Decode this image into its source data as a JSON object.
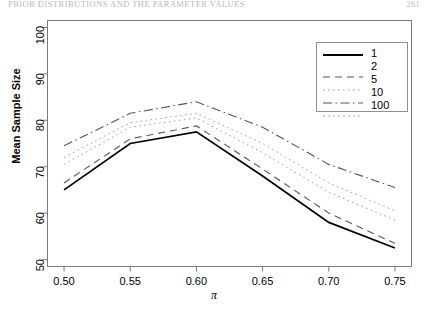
{
  "header": {
    "left": "PRIOR DISTRIBUTIONS AND THE PARAMETER VALUES",
    "right": "261"
  },
  "figure": {
    "ylabel": "Mean Sample Size",
    "xlabel": "π"
  },
  "legend": {
    "title": "",
    "entries": [
      {
        "label": "1",
        "style": "solid"
      },
      {
        "label": "2",
        "style": "dashed"
      },
      {
        "label": "5",
        "style": "dotted"
      },
      {
        "label": "10",
        "style": "dashdot"
      },
      {
        "label": "100",
        "style": "longdash"
      }
    ]
  },
  "chart_data": {
    "type": "line",
    "title": "",
    "xlabel": "π",
    "ylabel": "Mean Sample Size",
    "x": [
      0.5,
      0.55,
      0.6,
      0.65,
      0.7,
      0.75
    ],
    "xlim": [
      0.4875,
      0.7625
    ],
    "ylim": [
      48.5,
      101.5
    ],
    "xticks": [
      "0.50",
      "0.55",
      "0.60",
      "0.65",
      "0.70",
      "0.75"
    ],
    "yticks": [
      "50",
      "60",
      "70",
      "80",
      "90",
      "100"
    ],
    "xtick_values": [
      0.5,
      0.55,
      0.6,
      0.65,
      0.7,
      0.75
    ],
    "ytick_values": [
      50,
      60,
      70,
      80,
      90,
      100
    ],
    "grid": false,
    "legend_position": "top-right",
    "legend_title": "",
    "series": [
      {
        "name": "1",
        "style": "solid",
        "values": [
          65.0,
          75.0,
          77.5,
          68.0,
          58.0,
          52.5
        ]
      },
      {
        "name": "2",
        "style": "dashed",
        "values": [
          66.5,
          76.0,
          78.8,
          69.5,
          60.0,
          53.5
        ]
      },
      {
        "name": "5",
        "style": "dotted",
        "values": [
          70.5,
          78.5,
          80.5,
          73.0,
          64.5,
          58.5
        ]
      },
      {
        "name": "10",
        "style": "dashdot",
        "values": [
          74.5,
          81.5,
          84.0,
          78.5,
          70.5,
          65.5
        ]
      },
      {
        "name": "100",
        "style": "longdash",
        "values": [
          72.0,
          79.5,
          81.5,
          75.0,
          66.5,
          60.5
        ]
      }
    ]
  }
}
